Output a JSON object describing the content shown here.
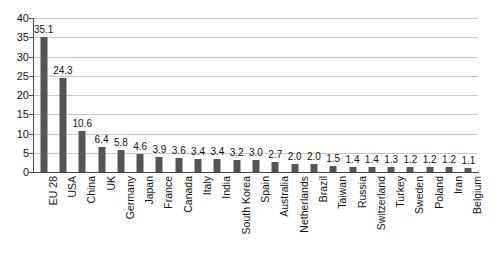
{
  "chart_data": {
    "type": "bar",
    "title": "",
    "subtitle": "",
    "xlabel": "",
    "ylabel": "",
    "ylim": [
      0,
      40
    ],
    "ytick_step": 5,
    "yticks": [
      "40",
      "35",
      "30",
      "25",
      "20",
      "15",
      "10",
      "5",
      "0"
    ],
    "grid": true,
    "legend": false,
    "orientation": "vertical",
    "bar_color": "#555555",
    "gridline_color": "#c9c9c9",
    "axis_color": "#4a4a4a",
    "background_color": "#ffffff",
    "categories": [
      "EU 28",
      "USA",
      "China",
      "UK",
      "Germany",
      "Japan",
      "France",
      "Canada",
      "Italy",
      "India",
      "South Korea",
      "Spain",
      "Australia",
      "Netherlands",
      "Brazil",
      "Taiwan",
      "Russia",
      "Switzerland",
      "Turkey",
      "Sweden",
      "Poland",
      "Iran",
      "Belgium"
    ],
    "values": [
      35.1,
      24.3,
      10.6,
      6.4,
      5.8,
      4.6,
      3.9,
      3.6,
      3.4,
      3.4,
      3.2,
      3.0,
      2.7,
      2.0,
      2.0,
      1.5,
      1.4,
      1.4,
      1.3,
      1.2,
      1.2,
      1.2,
      1.1
    ],
    "value_labels": [
      "35.1",
      "24.3",
      "10.6",
      "6.4",
      "5.8",
      "4.6",
      "3.9",
      "3.6",
      "3.4",
      "3.4",
      "3.2",
      "3.0",
      "2.7",
      "2.0",
      "2.0",
      "1.5",
      "1.4",
      "1.4",
      "1.3",
      "1.2",
      "1.2",
      "1.2",
      "1.1"
    ]
  }
}
